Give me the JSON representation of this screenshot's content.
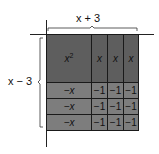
{
  "diagram": {
    "type": "algebra-tiles-area-model",
    "top_label": "x + 3",
    "left_label": "x − 3",
    "colors": {
      "positive_tile": "#5e5e5e",
      "negative_tile": "#7d7d7d",
      "line": "#1a1a1a"
    },
    "grid": {
      "rows": [
        [
          "x²",
          "x",
          "x",
          "x"
        ],
        [
          "−x",
          "−1",
          "−1",
          "−1"
        ],
        [
          "−x",
          "−1",
          "−1",
          "−1"
        ],
        [
          "−x",
          "−1",
          "−1",
          "−1"
        ]
      ]
    },
    "tiles": {
      "x_squared": "x",
      "x_squared_exp": "2",
      "x": "x",
      "neg_x": "−x",
      "neg_one": "−1"
    }
  }
}
